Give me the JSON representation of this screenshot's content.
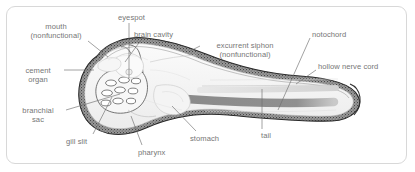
{
  "figure": {
    "orientation": "head-left-tail-right",
    "frame_color": "#d8d8d8",
    "background_color": "#ffffff",
    "label_color": "#767676",
    "leader_color": "#6f6f6f",
    "body_wall_color": "#3a3a3a",
    "notochord_color": "#8d8d8d",
    "interior_color": "#f3f3f3"
  },
  "labels": [
    {
      "id": "mouth",
      "line1": "mouth",
      "line2": "(nonfunctional)",
      "x": 18,
      "y": 22,
      "align": "center",
      "width": 76
    },
    {
      "id": "cement-organ",
      "line1": "cement",
      "line2": "organ",
      "x": 14,
      "y": 66,
      "align": "center",
      "width": 48
    },
    {
      "id": "branchial-sac",
      "line1": "branchial",
      "line2": "sac",
      "x": 12,
      "y": 106,
      "align": "center",
      "width": 52
    },
    {
      "id": "eyespot",
      "line1": "eyespot",
      "line2": "",
      "x": 118,
      "y": 13,
      "align": "left",
      "width": 40
    },
    {
      "id": "brain-cavity",
      "line1": "brain cavity",
      "line2": "",
      "x": 134,
      "y": 30,
      "align": "left",
      "width": 58
    },
    {
      "id": "excurrent-siphon",
      "line1": "excurrent siphon",
      "line2": "(nonfunctional)",
      "x": 203,
      "y": 41,
      "align": "center",
      "width": 84
    },
    {
      "id": "notochord",
      "line1": "notochord",
      "line2": "",
      "x": 312,
      "y": 30,
      "align": "left",
      "width": 48
    },
    {
      "id": "hollow-nerve-cord",
      "line1": "hollow nerve cord",
      "line2": "",
      "x": 318,
      "y": 62,
      "align": "left",
      "width": 74
    },
    {
      "id": "gill-slit",
      "line1": "gill slit",
      "line2": "",
      "x": 66,
      "y": 137,
      "align": "left",
      "width": 34
    },
    {
      "id": "pharynx",
      "line1": "pharynx",
      "line2": "",
      "x": 138,
      "y": 148,
      "align": "left",
      "width": 40
    },
    {
      "id": "stomach",
      "line1": "stomach",
      "line2": "",
      "x": 190,
      "y": 134,
      "align": "left",
      "width": 42
    },
    {
      "id": "tail",
      "line1": "tail",
      "line2": "",
      "x": 261,
      "y": 131,
      "align": "left",
      "width": 20
    }
  ],
  "leaders": [
    {
      "id": "mouth-leader",
      "path": "M 88,41 L 108,57"
    },
    {
      "id": "cement-organ-leader",
      "path": "M 64,70 L 94,70"
    },
    {
      "id": "branchial-sac-leader",
      "path": "M 66,110 L 120,94"
    },
    {
      "id": "eyespot-leader",
      "path": "M 129,23 L 129,78"
    },
    {
      "id": "brain-cavity-leader",
      "path": "M 141,40 L 125,62"
    },
    {
      "id": "excurrent-siphon-leader",
      "path": "M 200,46 L 190,51"
    },
    {
      "id": "notochord-leader",
      "path": "M 310,38 L 278,110"
    },
    {
      "id": "nerve-cord-leader",
      "path": "M 316,70 L 296,84"
    },
    {
      "id": "gill-slit-leader",
      "path": "M 93,134 L 112,97"
    },
    {
      "id": "pharynx-leader",
      "path": "M 142,145 L 131,116"
    },
    {
      "id": "stomach-leader",
      "path": "M 196,131 L 172,106"
    },
    {
      "id": "tail-leader",
      "path": "M 262,129 L 262,89"
    }
  ],
  "gill_slits": [
    {
      "cx": 111,
      "cy": 83
    },
    {
      "cx": 124,
      "cy": 80
    },
    {
      "cx": 136,
      "cy": 81
    },
    {
      "cx": 107,
      "cy": 93
    },
    {
      "cx": 120,
      "cy": 90
    },
    {
      "cx": 133,
      "cy": 91
    },
    {
      "cx": 106,
      "cy": 103
    },
    {
      "cx": 118,
      "cy": 101
    },
    {
      "cx": 131,
      "cy": 101
    }
  ]
}
